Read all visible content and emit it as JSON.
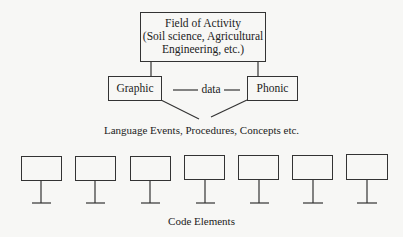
{
  "diagram": {
    "top_box": {
      "line1": "Field of Activity",
      "line2": "(Soil science, Agricultural",
      "line3": "Engineering, etc.)"
    },
    "left_box": {
      "label": "Graphic"
    },
    "right_box": {
      "label": "Phonic"
    },
    "connector_label": "data",
    "merge_caption": "Language Events, Procedures, Concepts etc.",
    "code_elements": {
      "count": 7,
      "caption": "Code Elements"
    }
  }
}
